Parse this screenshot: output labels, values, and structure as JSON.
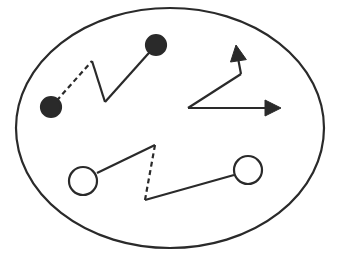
{
  "diagram": {
    "width": 343,
    "height": 258,
    "colors": {
      "stroke": "#2a2a2a",
      "fill_dark": "#2a2a2a",
      "fill_light": "#ffffff",
      "background": "#ffffff"
    },
    "boundary": {
      "shape": "ellipse",
      "cx": 170,
      "cy": 128,
      "rx": 154,
      "ry": 120
    },
    "elements": [
      {
        "id": "filled-pair",
        "kind": "connected-pair",
        "endpoint_style": "filled-circle",
        "endpoints": [
          {
            "x": 51,
            "y": 107,
            "r": 10
          },
          {
            "x": 156,
            "y": 45,
            "r": 10
          }
        ],
        "segments": [
          {
            "from": [
              51,
              107
            ],
            "to": [
              92,
              61
            ],
            "style": "dashed"
          },
          {
            "from": [
              92,
              61
            ],
            "to": [
              105,
              102
            ],
            "style": "solid"
          },
          {
            "from": [
              105,
              102
            ],
            "to": [
              156,
              45
            ],
            "style": "solid"
          }
        ]
      },
      {
        "id": "arrow-pair",
        "kind": "arrows",
        "origin": {
          "x": 188,
          "y": 108
        },
        "segments": [
          {
            "from": [
              188,
              108
            ],
            "to": [
              241,
              74
            ],
            "style": "solid"
          },
          {
            "from": [
              241,
              74
            ],
            "to": [
              238,
              58
            ],
            "style": "solid",
            "arrowhead": {
              "tip": [
                236,
                45
              ],
              "direction": "up"
            }
          },
          {
            "from": [
              188,
              108
            ],
            "to": [
              265,
              108
            ],
            "style": "solid",
            "arrowhead": {
              "tip": [
                281,
                108
              ],
              "direction": "right"
            }
          }
        ]
      },
      {
        "id": "hollow-pair",
        "kind": "connected-pair",
        "endpoint_style": "hollow-circle",
        "endpoints": [
          {
            "x": 83,
            "y": 181,
            "r": 14
          },
          {
            "x": 248,
            "y": 170,
            "r": 14
          }
        ],
        "segments": [
          {
            "from": [
              97,
              173
            ],
            "to": [
              155,
              145
            ],
            "style": "solid"
          },
          {
            "from": [
              155,
              145
            ],
            "to": [
              145,
              200
            ],
            "style": "dashed"
          },
          {
            "from": [
              145,
              200
            ],
            "to": [
              234,
              175
            ],
            "style": "solid"
          }
        ]
      }
    ]
  }
}
